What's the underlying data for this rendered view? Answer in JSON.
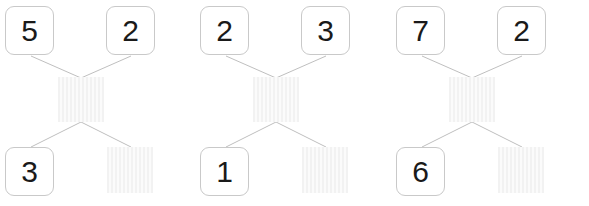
{
  "page": {
    "background_color": "#ffffff",
    "line_color": "#bfbfbf",
    "box_border_color": "#c9c9c9",
    "digit_color": "#1a1a1a",
    "blank_fill_color": "#f2f2f2",
    "layout": "three number-bond diagrams in a row"
  },
  "groups": [
    {
      "id": "number-bond-1",
      "top_left": {
        "value": "5",
        "filled": true
      },
      "top_right": {
        "value": "2",
        "filled": true
      },
      "middle": {
        "value": "",
        "filled": false
      },
      "bottom_left": {
        "value": "3",
        "filled": true
      },
      "bottom_right": {
        "value": "",
        "filled": false
      }
    },
    {
      "id": "number-bond-2",
      "top_left": {
        "value": "2",
        "filled": true
      },
      "top_right": {
        "value": "3",
        "filled": true
      },
      "middle": {
        "value": "",
        "filled": false
      },
      "bottom_left": {
        "value": "1",
        "filled": true
      },
      "bottom_right": {
        "value": "",
        "filled": false
      }
    },
    {
      "id": "number-bond-3",
      "top_left": {
        "value": "7",
        "filled": true
      },
      "top_right": {
        "value": "2",
        "filled": true
      },
      "middle": {
        "value": "",
        "filled": false
      },
      "bottom_left": {
        "value": "6",
        "filled": true
      },
      "bottom_right": {
        "value": "",
        "filled": false
      }
    }
  ]
}
